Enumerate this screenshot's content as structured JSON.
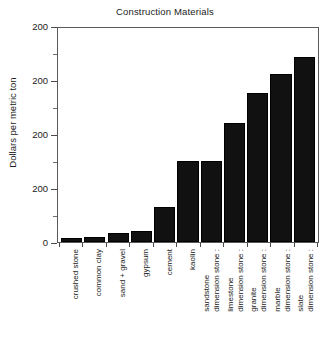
{
  "chart_data": {
    "type": "bar",
    "title": "Construction Materials",
    "xlabel": "",
    "ylabel": "Dollars per metric ton",
    "ylim": [
      0,
      300
    ],
    "grid": false,
    "legend": null,
    "ytick_labels": [
      "200",
      "200",
      "200",
      "200",
      "0"
    ],
    "categories": [
      "crushed stone",
      "common clay",
      "sand + gravel",
      "gypsum",
      "cement",
      "kaolin",
      "dimension stone : sandstone",
      "dimension stone : limestone",
      "dimension stone : granite",
      "dimension stone : marble",
      "dimension stone : slate"
    ],
    "category_lines": [
      [
        "crushed stone"
      ],
      [
        "common clay"
      ],
      [
        "sand + gravel"
      ],
      [
        "gypsum"
      ],
      [
        "cement"
      ],
      [
        "kaolin"
      ],
      [
        "dimension stone :",
        "sandstone"
      ],
      [
        "dimension stone :",
        "limestone"
      ],
      [
        "dimension stone :",
        "granite"
      ],
      [
        "dimension stone :",
        "marble"
      ],
      [
        "dimension stone :",
        "slate"
      ]
    ],
    "values": [
      5,
      7,
      12,
      15,
      48,
      113,
      113,
      165,
      207,
      233,
      257
    ],
    "bar_color": "#111111",
    "axis_color": "#4a4a4a"
  }
}
